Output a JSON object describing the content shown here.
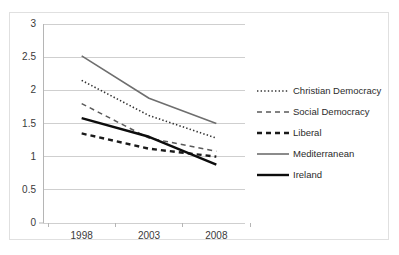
{
  "chart_data": {
    "type": "line",
    "title": "",
    "xlabel": "",
    "ylabel": "",
    "x": [
      "1998",
      "2003",
      "2008"
    ],
    "categories": [
      "1998",
      "2003",
      "2008"
    ],
    "ylim": [
      0,
      3
    ],
    "ytick_labels": [
      "0",
      "0.5",
      "1",
      "1.5",
      "2",
      "2.5",
      "3"
    ],
    "ytick_values": [
      0,
      0.5,
      1,
      1.5,
      2,
      2.5,
      3
    ],
    "xtick_labels": [
      "1998",
      "2003",
      "2008"
    ],
    "grid": "horizontal",
    "legend_position": "right",
    "series": [
      {
        "name": "Christian Democracy",
        "style": "dotted",
        "color": "#333333",
        "width": 1.6,
        "values": [
          2.15,
          1.62,
          1.28
        ]
      },
      {
        "name": "Social Democracy",
        "style": "dashed-thin",
        "color": "#5a5a5a",
        "width": 1.5,
        "values": [
          1.8,
          1.28,
          1.08
        ]
      },
      {
        "name": "Liberal",
        "style": "dashed-thick",
        "color": "#1a1a1a",
        "width": 2.4,
        "values": [
          1.35,
          1.12,
          1.0
        ]
      },
      {
        "name": "Mediterranean",
        "style": "solid-thin",
        "color": "#6e6e6e",
        "width": 1.6,
        "values": [
          2.52,
          1.88,
          1.5
        ]
      },
      {
        "name": "Ireland",
        "style": "solid-thick",
        "color": "#0d0d0d",
        "width": 2.4,
        "values": [
          1.58,
          1.3,
          0.88
        ]
      }
    ]
  },
  "legend": {
    "items": [
      {
        "label": "Christian Democracy"
      },
      {
        "label": "Social Democracy"
      },
      {
        "label": "Liberal"
      },
      {
        "label": "Mediterranean"
      },
      {
        "label": "Ireland"
      }
    ]
  },
  "axes": {
    "y_labels": [
      "3",
      "2.5",
      "2",
      "1.5",
      "1",
      "0.5",
      "0"
    ],
    "x_labels": [
      "1998",
      "2003",
      "2008"
    ]
  },
  "colors": {
    "grid": "#cfcfcf",
    "axis": "#b5b5b5",
    "frame": "#e0e0e0",
    "text": "#3a3a3a"
  }
}
